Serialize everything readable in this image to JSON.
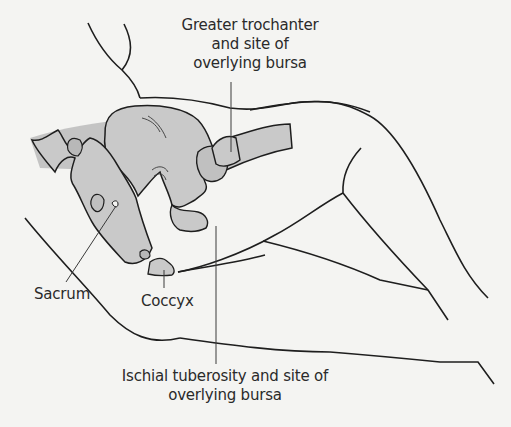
{
  "figure": {
    "type": "anatomical-line-drawing",
    "colors": {
      "background": "#f4f4f2",
      "outline": "#1e1e1e",
      "bone_fill": "#c9c9c9",
      "shadow_fill": "#b5b5b5",
      "leader_line": "#3a3a3a",
      "text": "#2a2a2a"
    }
  },
  "labels": {
    "greater_trochanter": {
      "line1": "Greater trochanter",
      "line2": "and site of",
      "line3": "overlying bursa"
    },
    "sacrum": "Sacrum",
    "coccyx": "Coccyx",
    "ischial_tuberosity": {
      "line1": "Ischial tuberosity and site of",
      "line2": "overlying bursa"
    }
  }
}
